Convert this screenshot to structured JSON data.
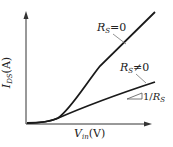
{
  "diagram": {
    "y_axis": {
      "symbol": "I",
      "subscript": "DS",
      "unit": "(A)"
    },
    "x_axis": {
      "symbol": "V",
      "subscript": "in",
      "unit": "(V)"
    },
    "curves": [
      {
        "label_symbol": "R",
        "label_subscript": "S",
        "label_rel": "=0"
      },
      {
        "label_symbol": "R",
        "label_subscript": "S",
        "label_rel": "≠0"
      }
    ],
    "slope_label": {
      "prefix": "1/",
      "symbol": "R",
      "subscript": "S"
    },
    "colors": {
      "line": "#1a1a1a",
      "leader": "#777777"
    }
  }
}
